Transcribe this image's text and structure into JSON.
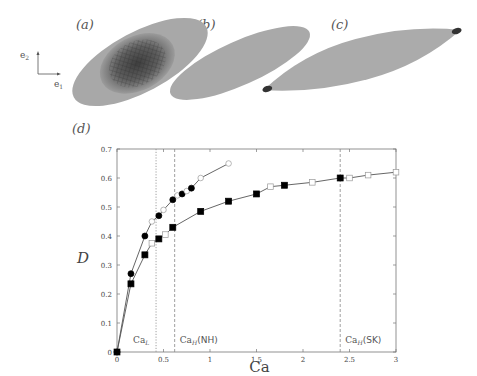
{
  "panels": {
    "a": "(a)",
    "b": "(b)",
    "c": "(c)",
    "d": "(d)"
  },
  "axes_triad": {
    "e2": "e",
    "e2_sub": "2",
    "e1": "e",
    "e1_sub": "1"
  },
  "chart_data": {
    "type": "line",
    "title": "",
    "xlabel": "Ca",
    "ylabel": "D",
    "xlim": [
      0,
      3
    ],
    "ylim": [
      0,
      0.7
    ],
    "xticks": [
      "0",
      "0.5",
      "1",
      "1.5",
      "2",
      "2.5",
      "3"
    ],
    "yticks": [
      "0",
      "0.1",
      "0.2",
      "0.3",
      "0.4",
      "0.5",
      "0.6",
      "0.7"
    ],
    "grid": false,
    "series": [
      {
        "name": "NH (circles)",
        "marker": "circle",
        "points": [
          {
            "x": 0,
            "y": 0,
            "filled": true
          },
          {
            "x": 0.15,
            "y": 0.27,
            "filled": true
          },
          {
            "x": 0.3,
            "y": 0.4,
            "filled": true
          },
          {
            "x": 0.375,
            "y": 0.45,
            "filled": false
          },
          {
            "x": 0.45,
            "y": 0.47,
            "filled": true
          },
          {
            "x": 0.5,
            "y": 0.49,
            "filled": false
          },
          {
            "x": 0.6,
            "y": 0.525,
            "filled": true
          },
          {
            "x": 0.65,
            "y": 0.54,
            "filled": false
          },
          {
            "x": 0.7,
            "y": 0.545,
            "filled": true
          },
          {
            "x": 0.75,
            "y": 0.555,
            "filled": false
          },
          {
            "x": 0.8,
            "y": 0.565,
            "filled": true
          },
          {
            "x": 0.9,
            "y": 0.6,
            "filled": false
          },
          {
            "x": 1.2,
            "y": 0.65,
            "filled": false
          }
        ]
      },
      {
        "name": "SK (squares)",
        "marker": "square",
        "points": [
          {
            "x": 0,
            "y": 0,
            "filled": true
          },
          {
            "x": 0.15,
            "y": 0.235,
            "filled": true
          },
          {
            "x": 0.3,
            "y": 0.335,
            "filled": true
          },
          {
            "x": 0.375,
            "y": 0.375,
            "filled": false
          },
          {
            "x": 0.45,
            "y": 0.39,
            "filled": true
          },
          {
            "x": 0.52,
            "y": 0.405,
            "filled": false
          },
          {
            "x": 0.6,
            "y": 0.43,
            "filled": true
          },
          {
            "x": 0.9,
            "y": 0.485,
            "filled": true
          },
          {
            "x": 1.2,
            "y": 0.52,
            "filled": true
          },
          {
            "x": 1.5,
            "y": 0.545,
            "filled": true
          },
          {
            "x": 1.65,
            "y": 0.57,
            "filled": false
          },
          {
            "x": 1.8,
            "y": 0.575,
            "filled": true
          },
          {
            "x": 2.1,
            "y": 0.585,
            "filled": false
          },
          {
            "x": 2.4,
            "y": 0.6,
            "filled": true
          },
          {
            "x": 2.5,
            "y": 0.6,
            "filled": false
          },
          {
            "x": 2.7,
            "y": 0.61,
            "filled": false
          },
          {
            "x": 3.0,
            "y": 0.62,
            "filled": false
          }
        ]
      }
    ],
    "annotations": [
      {
        "type": "vline",
        "x": 0.42,
        "style": "dotted",
        "label": "Ca",
        "sub": "L",
        "suffix": ""
      },
      {
        "type": "vline",
        "x": 0.62,
        "style": "dashed",
        "label": "Ca",
        "sub": "H",
        "suffix": "(NH)"
      },
      {
        "type": "vline",
        "x": 2.4,
        "style": "dashed",
        "label": "Ca",
        "sub": "H",
        "suffix": "(SK)"
      }
    ]
  }
}
